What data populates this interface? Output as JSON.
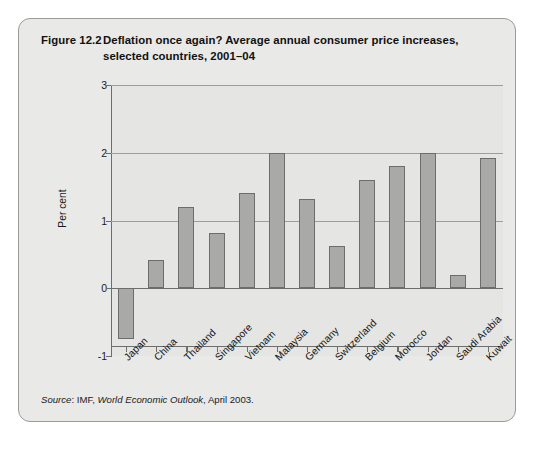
{
  "figure": {
    "number": "Figure 12.2",
    "title_line1": "Deflation once again? Average annual consumer price increases,",
    "title_line2": "selected countries, 2001–04",
    "source_prefix": "Source",
    "source_sep": ": IMF, ",
    "source_italic": "World Economic Outlook",
    "source_suffix": ", April 2003."
  },
  "chart_data": {
    "type": "bar",
    "xlabel": "",
    "ylabel": "Per cent",
    "ylim": [
      -1,
      3
    ],
    "yticks": [
      -1,
      0,
      1,
      2,
      3
    ],
    "ytick_labels": [
      "-1",
      "0",
      "1",
      "2",
      "3"
    ],
    "gridlines": [
      0,
      1,
      2,
      3
    ],
    "grid": true,
    "legend": null,
    "bar_color": "#a9a9a7",
    "bar_edge_color": "#6d6d6b",
    "plot_background": "#e5e5e3",
    "categories": [
      "Japan",
      "China",
      "Thailand",
      "Singapore",
      "Vietnam",
      "Malaysia",
      "Germany",
      "Switzerland",
      "Belgium",
      "Morocco",
      "Jordan",
      "Saudi Arabia",
      "Kuwait"
    ],
    "values": [
      -0.75,
      0.42,
      1.2,
      0.82,
      1.4,
      2.0,
      1.32,
      0.62,
      1.6,
      1.8,
      2.0,
      0.2,
      1.92
    ]
  }
}
